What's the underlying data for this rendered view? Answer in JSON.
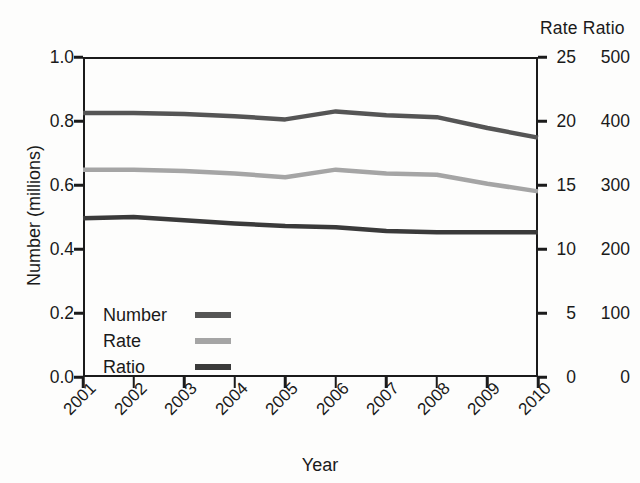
{
  "chart_data": {
    "type": "line",
    "title": "",
    "xlabel": "Year",
    "ylabel": "Number (millions)",
    "secondary_axis_header": "Rate Ratio",
    "categories": [
      "2001",
      "2002",
      "2003",
      "2004",
      "2005",
      "2006",
      "2007",
      "2008",
      "2009",
      "2010"
    ],
    "grid": false,
    "legend_position": "bottom-left",
    "axes": {
      "left": {
        "label": "Number (millions)",
        "ticks": [
          "1.0",
          "0.8",
          "0.6",
          "0.4",
          "0.2",
          "0.0"
        ],
        "tick_values": [
          1.0,
          0.8,
          0.6,
          0.4,
          0.2,
          0.0
        ],
        "lim": [
          0.0,
          1.0
        ]
      },
      "right_rate": {
        "label": "Rate",
        "ticks": [
          "25",
          "20",
          "15",
          "10",
          "5",
          "0"
        ],
        "tick_values": [
          25,
          20,
          15,
          10,
          5,
          0
        ],
        "lim": [
          0,
          25
        ]
      },
      "right_ratio": {
        "label": "Ratio",
        "ticks": [
          "500",
          "400",
          "300",
          "200",
          "100",
          "0"
        ],
        "tick_values": [
          500,
          400,
          300,
          200,
          100,
          0
        ],
        "lim": [
          0,
          500
        ]
      }
    },
    "series": [
      {
        "name": "Number",
        "axis": "left",
        "color": "#555555",
        "values": [
          0.825,
          0.825,
          0.822,
          0.815,
          0.805,
          0.83,
          0.818,
          0.812,
          0.778,
          0.748
        ]
      },
      {
        "name": "Rate",
        "axis": "right_rate",
        "color": "#a5a5a5",
        "values": [
          16.2,
          16.2,
          16.1,
          15.9,
          15.6,
          16.2,
          15.9,
          15.8,
          15.1,
          14.5
        ]
      },
      {
        "name": "Ratio",
        "axis": "right_ratio",
        "color": "#3a3a3a",
        "values": [
          248,
          250,
          245,
          240,
          236,
          234,
          228,
          226,
          226,
          226
        ]
      }
    ]
  },
  "legend": {
    "items": [
      {
        "label": "Number",
        "color": "#555555"
      },
      {
        "label": "Rate",
        "color": "#a5a5a5"
      },
      {
        "label": "Ratio",
        "color": "#3a3a3a"
      }
    ]
  },
  "colors": {
    "axis": "#1b1b1b",
    "background": "#fdfdfc",
    "text": "#1a1a1a"
  }
}
